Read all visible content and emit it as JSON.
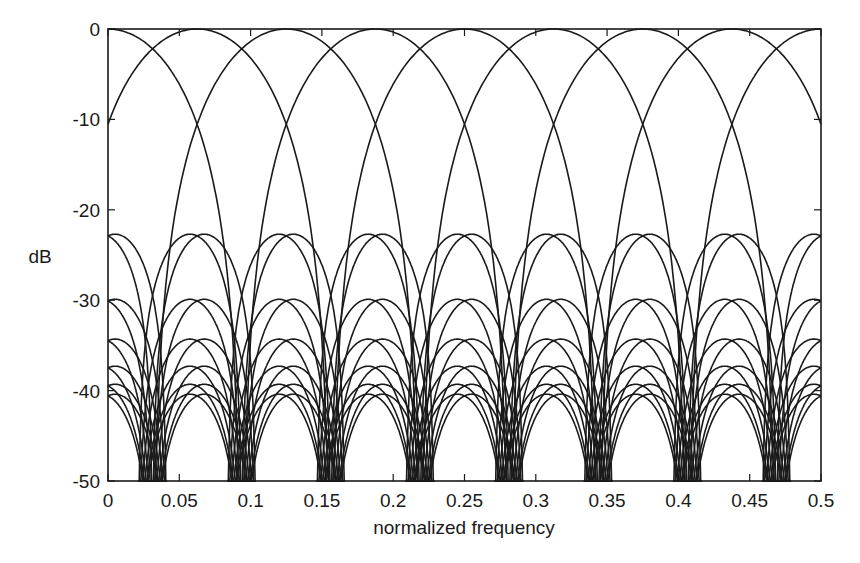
{
  "chart_data": {
    "type": "line",
    "title": "",
    "xlabel": "normalized frequency",
    "ylabel": "dB",
    "xlim": [
      0,
      0.5
    ],
    "ylim": [
      -50,
      0
    ],
    "grid": false,
    "legend": null,
    "x_ticks": [
      0,
      0.05,
      0.1,
      0.15,
      0.2,
      0.25,
      0.3,
      0.35,
      0.4,
      0.45,
      0.5
    ],
    "x_tick_labels": [
      "0",
      "0.05",
      "0.1",
      "0.15",
      "0.2",
      "0.25",
      "0.3",
      "0.35",
      "0.4",
      "0.45",
      "0.5"
    ],
    "y_ticks": [
      0,
      -10,
      -20,
      -30,
      -40,
      -50
    ],
    "y_tick_labels": [
      "0",
      "-10",
      "-20",
      "-30",
      "-40",
      "-50"
    ],
    "line_color": "#1a1a1a",
    "series_description": "Overlaid magnitude responses of a bank of bandpass filters; main lobes centered every 1/16 in normalized frequency, adjacent main lobes cross at about -2.3 dB (at odd multiples of 1/32) and about -10 dB (at multiples of 1/16); sidelobe families peak at the listed levels with nulls at odd multiples of 1/32",
    "main_lobe": {
      "centers": [
        0,
        0.0625,
        0.125,
        0.1875,
        0.25,
        0.3125,
        0.375,
        0.4375,
        0.5
      ],
      "null_half_width": 0.09375,
      "crossing_levels_db": [
        -2.3,
        -10
      ]
    },
    "sidelobes": {
      "centers": [
        0,
        0.0625,
        0.125,
        0.1875,
        0.25,
        0.3125,
        0.375,
        0.4375,
        0.5
      ],
      "null_half_width": 0.03125,
      "peak_levels_db": [
        -22.7,
        -29.9,
        -34.3,
        -37.3,
        -39.3,
        -40.4
      ],
      "pair_offset": 0.005
    },
    "nulls": [
      0.03125,
      0.09375,
      0.15625,
      0.21875,
      0.28125,
      0.34375,
      0.40625,
      0.46875
    ]
  }
}
